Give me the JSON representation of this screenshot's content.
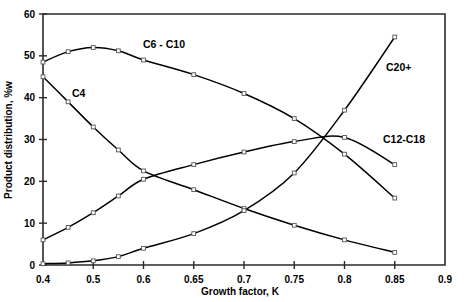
{
  "chart_data": {
    "type": "line",
    "title": "",
    "xlabel": "Growth factor, K",
    "ylabel": "Product distribution, %w",
    "x": [
      0.4,
      0.45,
      0.5,
      0.55,
      0.6,
      0.65,
      0.7,
      0.75,
      0.8,
      0.85
    ],
    "xtick_labels": [
      "0.4",
      "0.5",
      "0.6",
      "0.65",
      "0.7",
      "0.75",
      "0.8",
      "0.85",
      "0.9"
    ],
    "xtick_values": [
      0.4,
      0.5,
      0.6,
      0.65,
      0.7,
      0.75,
      0.8,
      0.85,
      0.9
    ],
    "xaxis_note": "ticks evenly spaced by index, not by value",
    "ytick_labels": [
      "0",
      "10",
      "20",
      "30",
      "40",
      "50",
      "60"
    ],
    "ytick_values": [
      0,
      10,
      20,
      30,
      40,
      50,
      60
    ],
    "ylim": [
      0,
      60
    ],
    "grid": false,
    "legend": "inline-labels",
    "series": [
      {
        "name": "C6 - C10",
        "label": "C6 - C10",
        "x": [
          0.4,
          0.45,
          0.5,
          0.55,
          0.6,
          0.65,
          0.7,
          0.75,
          0.8,
          0.85
        ],
        "values": [
          48.5,
          51.0,
          52.0,
          51.2,
          49.0,
          45.5,
          41.0,
          35.0,
          26.5,
          16.0
        ]
      },
      {
        "name": "C4",
        "label": "C4",
        "x": [
          0.4,
          0.45,
          0.5,
          0.55,
          0.6,
          0.65,
          0.7,
          0.75,
          0.8,
          0.85
        ],
        "values": [
          45.0,
          39.0,
          33.0,
          27.5,
          22.5,
          18.0,
          13.5,
          9.5,
          6.0,
          3.0
        ]
      },
      {
        "name": "C12-C18",
        "label": "C12-C18",
        "x": [
          0.4,
          0.45,
          0.5,
          0.55,
          0.6,
          0.65,
          0.7,
          0.75,
          0.8,
          0.85
        ],
        "values": [
          6.0,
          9.0,
          12.5,
          16.5,
          20.5,
          24.0,
          27.0,
          29.5,
          30.5,
          24.0
        ]
      },
      {
        "name": "C20+",
        "label": "C20+",
        "x": [
          0.4,
          0.45,
          0.5,
          0.55,
          0.6,
          0.65,
          0.7,
          0.75,
          0.8,
          0.85
        ],
        "values": [
          0.3,
          0.5,
          1.0,
          2.0,
          4.0,
          7.5,
          13.0,
          22.0,
          37.0,
          54.5
        ]
      }
    ],
    "annotations": [
      {
        "text": "C6 - C10",
        "x_px": 143,
        "y_px": 48
      },
      {
        "text": "C4",
        "x_px": 72,
        "y_px": 97
      },
      {
        "text": "C20+",
        "x_px": 386,
        "y_px": 71
      },
      {
        "text": "C12-C18",
        "x_px": 383,
        "y_px": 143
      }
    ]
  },
  "caption": {
    "text": ""
  }
}
